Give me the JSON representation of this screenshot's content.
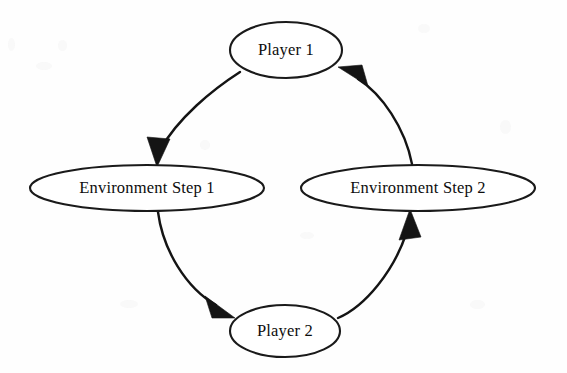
{
  "diagram": {
    "background_color": "#fefefe",
    "stroke_color": "#141414",
    "text_color": "#0d0d0d",
    "nodes": [
      {
        "id": "player-1",
        "label": "Player 1",
        "cx": 286,
        "cy": 50,
        "rx": 56,
        "ry": 28
      },
      {
        "id": "environment-step-1",
        "label": "Environment Step 1",
        "cx": 147,
        "cy": 188,
        "rx": 117,
        "ry": 23
      },
      {
        "id": "environment-step-2",
        "label": "Environment Step 2",
        "cx": 418,
        "cy": 188,
        "rx": 117,
        "ry": 23
      },
      {
        "id": "player-2",
        "label": "Player 2",
        "cx": 285,
        "cy": 331,
        "rx": 55,
        "ry": 26
      }
    ],
    "edges": [
      {
        "id": "edge-player1-to-env1",
        "from": "Player 1",
        "to": "Environment Step 1",
        "direction": "clockwise",
        "arrow_direction": "down"
      },
      {
        "id": "edge-env1-to-player2",
        "from": "Environment Step 1",
        "to": "Player 2",
        "direction": "clockwise",
        "arrow_direction": "down-right"
      },
      {
        "id": "edge-player2-to-env2",
        "from": "Player 2",
        "to": "Environment Step 2",
        "direction": "clockwise",
        "arrow_direction": "up"
      },
      {
        "id": "edge-env2-to-player1",
        "from": "Environment Step 2",
        "to": "Player 1",
        "direction": "clockwise",
        "arrow_direction": "up-left"
      }
    ]
  }
}
